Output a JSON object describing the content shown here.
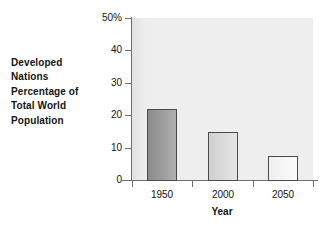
{
  "caption": {
    "lines": [
      "Developed",
      "Nations",
      "Percentage of",
      "Total World",
      "Population"
    ]
  },
  "chart_data": {
    "type": "bar",
    "title": "",
    "subtitle": "",
    "categories": [
      "1950",
      "2000",
      "2050"
    ],
    "values": [
      22,
      14.8,
      7.4
    ],
    "series": [
      {
        "name": "Developed Nations Percentage of Total World Population",
        "values": [
          22,
          14.8,
          7.4
        ]
      }
    ],
    "xlabel": "Year",
    "ylabel": "Developed Nations Percentage of Total World Population",
    "ylim": [
      0,
      50
    ],
    "yticks": [
      0,
      10,
      20,
      30,
      40,
      50
    ],
    "ytick_labels": [
      "0",
      "10",
      "20",
      "30",
      "40",
      "50%"
    ],
    "xtick_labels": [
      "1950",
      "2000",
      "2050"
    ],
    "grid": false,
    "legend": false,
    "unit": "%",
    "bar_colors": [
      "#9a9a9a",
      "#dadada",
      "#f5f5f5"
    ],
    "bar_edge_color": "#4a4a4a",
    "plot_background": "#eeeeee",
    "axis_color": "#6f6f6f",
    "text_color": "#141414"
  }
}
